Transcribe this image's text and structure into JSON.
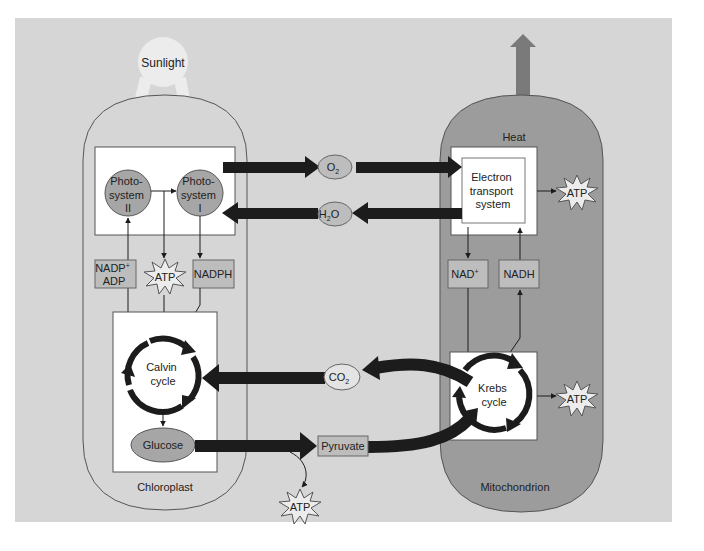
{
  "colors": {
    "background": "#d6d6d6",
    "mitochondrion": "#9c9c9c",
    "chloroplast": "#d6d6d6",
    "box_fill": "#ffffff",
    "node_fill": "#a6a6a6",
    "label_box_fill": "#bdbdbd",
    "arrow": "#1c1c1c",
    "sunlight": "#ececec",
    "heat_arrow": "#7a7a7a"
  },
  "labels": {
    "sunlight": "Sunlight",
    "heat": "Heat",
    "chloroplast": "Chloroplast",
    "mitochondrion": "Mitochondrion"
  },
  "chloroplast": {
    "photosystem_ii": [
      "Photo-",
      "system",
      "II"
    ],
    "photosystem_i": [
      "Photo-",
      "system",
      "I"
    ],
    "nadp_adp": {
      "line1": "NADP",
      "line1_sup": "+",
      "line2": "ADP"
    },
    "atp": "ATP",
    "nadph": "NADPH",
    "calvin_cycle": [
      "Calvin",
      "cycle"
    ],
    "glucose": "Glucose"
  },
  "mitochondrion_parts": {
    "electron_transport": [
      "Electron",
      "transport",
      "system"
    ],
    "atp_ets": "ATP",
    "nad": {
      "base": "NAD",
      "sup": "+"
    },
    "nadh": "NADH",
    "krebs_cycle": [
      "Krebs",
      "cycle"
    ],
    "atp_krebs": "ATP"
  },
  "exchange": {
    "o2": {
      "base": "O",
      "sub": "2"
    },
    "h2o": {
      "pre": "H",
      "sub": "2",
      "post": "O"
    },
    "co2": {
      "base": "CO",
      "sub": "2"
    },
    "pyruvate": "Pyruvate",
    "atp_glycolysis": "ATP"
  }
}
